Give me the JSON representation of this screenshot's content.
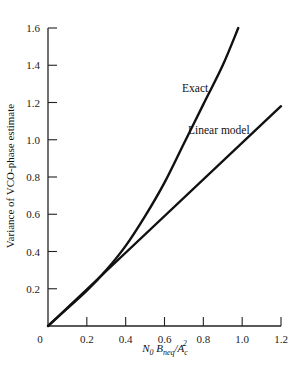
{
  "chart_data": {
    "type": "line",
    "title": "",
    "xlabel": "N0 Bneq/Ac^2",
    "xlabel_parts": {
      "n": "N",
      "n_sub": "0",
      "b": "B",
      "b_sub": "neq",
      "slash": "/",
      "a": "A",
      "a_sub": "c",
      "a_sup": "2"
    },
    "ylabel": "Variance of VCO-phase estimate",
    "xlim": [
      0,
      1.2
    ],
    "ylim": [
      0,
      1.6
    ],
    "x_ticks": [
      0,
      0.2,
      0.4,
      0.6,
      0.8,
      1.0,
      1.2
    ],
    "x_tick_labels": [
      "0",
      "0.2",
      "0.4",
      "0.6",
      "0.8",
      "1.0",
      "1.2"
    ],
    "y_ticks": [
      0.2,
      0.4,
      0.6,
      0.8,
      1.0,
      1.2,
      1.4,
      1.6
    ],
    "y_tick_labels": [
      "0.2",
      "0.4",
      "0.6",
      "0.8",
      "1.0",
      "1.2",
      "1.4",
      "1.6"
    ],
    "grid": false,
    "legend": "none (inline annotations)",
    "series": [
      {
        "name": "Exact",
        "x": [
          0,
          0.1,
          0.2,
          0.3,
          0.4,
          0.5,
          0.6,
          0.7,
          0.8,
          0.9,
          0.98
        ],
        "y": [
          0,
          0.095,
          0.19,
          0.3,
          0.43,
          0.59,
          0.77,
          0.98,
          1.19,
          1.4,
          1.6
        ]
      },
      {
        "name": "Linear model",
        "x": [
          0,
          1.2
        ],
        "y": [
          0,
          1.18
        ]
      }
    ],
    "annotations": [
      {
        "text": "Exact",
        "x": 0.56,
        "y": 1.24
      },
      {
        "text": "Linear model",
        "x": 0.78,
        "y": 1.04
      }
    ]
  }
}
